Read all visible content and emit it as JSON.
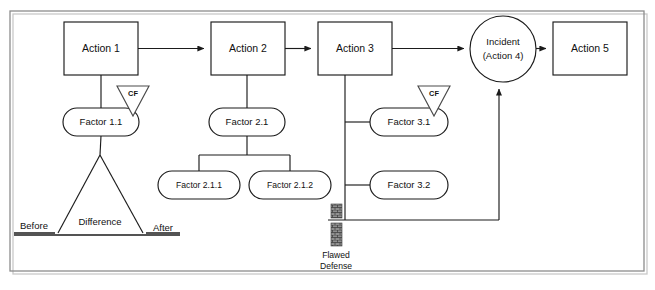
{
  "diagram": {
    "type": "events-and-causal-factors-chart",
    "frame": {
      "stroke_color": "#8d8d8d"
    },
    "colors": {
      "shape_stroke": "#1b1b1b",
      "shape_fill": "#ffffff",
      "text": "#111111",
      "frame": "#8d8d8d",
      "triangle_stroke": "#4a4a4a"
    },
    "events": [
      {
        "id": "action1",
        "label": "Action 1",
        "shape": "rectangle",
        "x": 64,
        "y": 22,
        "w": 74,
        "h": 53
      },
      {
        "id": "action2",
        "label": "Action 2",
        "shape": "rectangle",
        "x": 211,
        "y": 22,
        "w": 74,
        "h": 53
      },
      {
        "id": "action3",
        "label": "Action 3",
        "shape": "rectangle",
        "x": 318,
        "y": 22,
        "w": 74,
        "h": 53
      },
      {
        "id": "action4",
        "label_line1": "Incident",
        "label_line2": "(Action 4)",
        "shape": "circle",
        "cx": 503,
        "cy": 49,
        "r": 33
      },
      {
        "id": "action5",
        "label": "Action 5",
        "shape": "rectangle",
        "x": 553,
        "y": 22,
        "w": 74,
        "h": 53
      }
    ],
    "factors": [
      {
        "id": "factor11",
        "label": "Factor 1.1",
        "shape": "stadium",
        "cx": 101,
        "cy": 122,
        "w": 76,
        "h": 28
      },
      {
        "id": "factor21",
        "label": "Factor 2.1",
        "shape": "stadium",
        "cx": 247,
        "cy": 122,
        "w": 76,
        "h": 28
      },
      {
        "id": "factor211",
        "label": "Factor 2.1.1",
        "shape": "stadium",
        "cx": 199,
        "cy": 185,
        "w": 82,
        "h": 28
      },
      {
        "id": "factor212",
        "label": "Factor 2.1.2",
        "shape": "stadium",
        "cx": 290,
        "cy": 185,
        "w": 82,
        "h": 28
      },
      {
        "id": "factor31",
        "label": "Factor 3.1",
        "shape": "stadium",
        "cx": 409,
        "cy": 122,
        "w": 78,
        "h": 28
      },
      {
        "id": "factor32",
        "label": "Factor 3.2",
        "shape": "stadium",
        "cx": 409,
        "cy": 185,
        "w": 78,
        "h": 28
      }
    ],
    "causal_factor_markers": [
      {
        "id": "cf1",
        "label": "CF",
        "attached_to": "factor11",
        "cx": 133,
        "cy": 95
      },
      {
        "id": "cf2",
        "label": "CF",
        "attached_to": "factor31",
        "cx": 434,
        "cy": 95
      }
    ],
    "barriers": [
      {
        "id": "flawed-defense",
        "label_line1": "Flawed",
        "label_line2": "Defense",
        "x": 331,
        "y": 204,
        "type": "broken-barrier"
      }
    ],
    "comparison": {
      "id": "difference-triangle",
      "center_label": "Difference",
      "left_label": "Before",
      "right_label": "After",
      "apex_x": 100,
      "apex_y": 155,
      "base_y": 233,
      "base_left_x": 58,
      "base_right_x": 143
    }
  }
}
